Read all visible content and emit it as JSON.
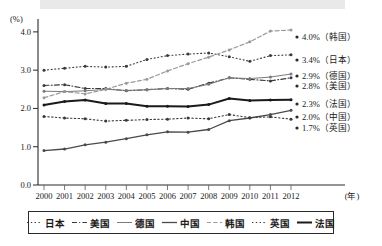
{
  "chart_data": {
    "type": "line",
    "title": "",
    "xlabel": "(年)",
    "ylabel": "(%)",
    "xlim": [
      2000,
      2012
    ],
    "ylim": [
      0.0,
      4.2
    ],
    "yticks": [
      "0.0",
      "1.0",
      "2.0",
      "3.0",
      "4.0"
    ],
    "ytick_values": [
      0.0,
      1.0,
      2.0,
      3.0,
      4.0
    ],
    "grid": false,
    "legend_position": "bottom",
    "categories": [
      2000,
      2001,
      2002,
      2003,
      2004,
      2005,
      2006,
      2007,
      2008,
      2009,
      2010,
      2011,
      2012
    ],
    "xtick_labels": [
      "2000",
      "2001",
      "2002",
      "2003",
      "2004",
      "2005",
      "2006",
      "2007",
      "2008",
      "2009",
      "2010",
      "2011",
      "2012"
    ],
    "series": [
      {
        "name": "日本",
        "label_en": "Japan",
        "style": "dotted",
        "color": "#3a3a3a",
        "width": 1.1,
        "dash": "1,2.6",
        "end_label": "3.4%（日本）",
        "end_value": "3.4",
        "values": [
          3.0,
          3.05,
          3.1,
          3.08,
          3.1,
          3.28,
          3.38,
          3.42,
          3.45,
          3.35,
          3.23,
          3.38,
          3.4
        ]
      },
      {
        "name": "美国",
        "label_en": "USA",
        "style": "dash-dot",
        "color": "#3a3a3a",
        "width": 1.1,
        "dash": "5,2.2,1,2.2",
        "end_label": "2.8%（美国）",
        "end_value": "2.8",
        "values": [
          2.6,
          2.62,
          2.52,
          2.52,
          2.46,
          2.49,
          2.52,
          2.5,
          2.66,
          2.8,
          2.76,
          2.72,
          2.8
        ]
      },
      {
        "name": "德国",
        "label_en": "Germany",
        "style": "solid-thin",
        "color": "#7a7a7a",
        "width": 1.0,
        "dash": "",
        "end_label": "2.9%（德国）",
        "end_value": "2.9",
        "values": [
          2.45,
          2.44,
          2.46,
          2.5,
          2.47,
          2.49,
          2.52,
          2.52,
          2.63,
          2.8,
          2.78,
          2.82,
          2.9
        ]
      },
      {
        "name": "中国",
        "label_en": "China",
        "style": "solid",
        "color": "#4a4a4a",
        "width": 1.3,
        "dash": "",
        "end_label": "2.0%（中国）",
        "end_value": "2.0",
        "values": [
          0.9,
          0.94,
          1.05,
          1.12,
          1.21,
          1.31,
          1.39,
          1.38,
          1.45,
          1.68,
          1.75,
          1.84,
          1.95
        ]
      },
      {
        "name": "韩国",
        "label_en": "Korea",
        "style": "dashed-light",
        "color": "#9a9a9a",
        "width": 1.2,
        "dash": "4,2.4",
        "end_label": "4.0%（韩国）",
        "end_value": "4.0",
        "values": [
          2.28,
          2.44,
          2.38,
          2.5,
          2.66,
          2.76,
          2.98,
          3.17,
          3.34,
          3.53,
          3.74,
          4.02,
          4.05
        ]
      },
      {
        "name": "英国",
        "label_en": "UK",
        "style": "dotted",
        "color": "#3a3a3a",
        "width": 1.1,
        "dash": "1.4,2.4",
        "end_label": "1.7%（英国）",
        "end_value": "1.7",
        "values": [
          1.79,
          1.75,
          1.73,
          1.67,
          1.69,
          1.71,
          1.72,
          1.75,
          1.73,
          1.84,
          1.76,
          1.78,
          1.72
        ]
      },
      {
        "name": "法国",
        "label_en": "France",
        "style": "solid-thick",
        "color": "#1a1a1a",
        "width": 2.0,
        "dash": "",
        "end_label": "2.3%（法国）",
        "end_value": "2.3",
        "values": [
          2.09,
          2.18,
          2.22,
          2.13,
          2.13,
          2.06,
          2.06,
          2.05,
          2.1,
          2.26,
          2.21,
          2.22,
          2.23
        ]
      }
    ],
    "end_labels": [
      {
        "text": "4.0%（韩国）",
        "value": 4.02,
        "y_px": 37
      },
      {
        "text": "3.4%（日本）",
        "value": 3.4,
        "y_px": 60
      },
      {
        "text": "2.9%（德国）",
        "value": 2.9,
        "y_px": 76
      },
      {
        "text": "2.8%（美国）",
        "value": 2.8,
        "y_px": 86
      },
      {
        "text": "2.3%（法国）",
        "value": 2.3,
        "y_px": 104
      },
      {
        "text": "2.0%（中国）",
        "value": 2.0,
        "y_px": 117
      },
      {
        "text": "1.7%（英国）",
        "value": 1.7,
        "y_px": 128
      }
    ],
    "legend": [
      {
        "label": "日本",
        "style": "dotted"
      },
      {
        "label": "美国",
        "style": "dash-dot"
      },
      {
        "label": "德国",
        "style": "solid-thin"
      },
      {
        "label": "中国",
        "style": "solid"
      },
      {
        "label": "韩国",
        "style": "dashed-light"
      },
      {
        "label": "英国",
        "style": "dotted"
      },
      {
        "label": "法国",
        "style": "solid-thick"
      }
    ]
  }
}
